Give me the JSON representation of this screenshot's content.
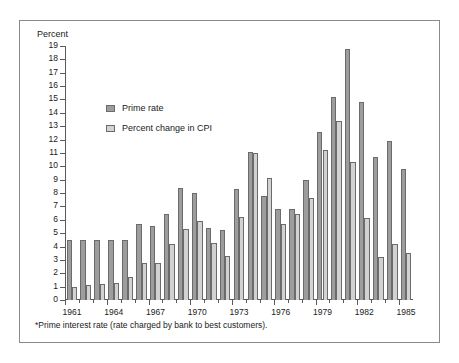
{
  "figure": {
    "y_axis_title": "Percent",
    "footnote": "*Prime interest rate (rate charged by bank to best customers)."
  },
  "legend": {
    "position": "inside-top-left",
    "entries": [
      {
        "label": "Prime rate",
        "color": "#9d9d9d",
        "swatch": "prime"
      },
      {
        "label": "Percent change in CPI",
        "color": "#d2d2d2",
        "swatch": "cpi"
      }
    ]
  },
  "chart_data": {
    "type": "bar",
    "title": "",
    "subtitle": "",
    "xlabel": "",
    "ylabel": "Percent",
    "ylim": [
      0,
      19
    ],
    "ytick_step": 1,
    "yticks": [
      0,
      1,
      2,
      3,
      4,
      5,
      6,
      7,
      8,
      9,
      10,
      11,
      12,
      13,
      14,
      15,
      16,
      17,
      18,
      19
    ],
    "ytick_labels": [
      "0",
      "1",
      "2",
      "3",
      "4",
      "5",
      "6",
      "7",
      "8",
      "9",
      "10",
      "11",
      "12",
      "13",
      "14",
      "15",
      "16",
      "17",
      "18",
      "19"
    ],
    "grid": false,
    "legend_position": "upper left (inside axes)",
    "annotations": [
      "*Prime interest rate (rate charged by bank to best customers)."
    ],
    "categories": [
      "1961",
      "1962",
      "1963",
      "1964",
      "1965",
      "1966",
      "1967",
      "1968",
      "1969",
      "1970",
      "1971",
      "1972",
      "1973",
      "1974",
      "1975",
      "1976",
      "1977",
      "1978",
      "1979",
      "1980",
      "1981",
      "1982",
      "1983",
      "1984",
      "1985"
    ],
    "xtick_labels": [
      "1961",
      "1964",
      "1967",
      "1970",
      "1973",
      "1976",
      "1979",
      "1982",
      "1985"
    ],
    "xtick_categories": [
      "1961",
      "1964",
      "1967",
      "1970",
      "1973",
      "1976",
      "1979",
      "1982",
      "1985"
    ],
    "series": [
      {
        "name": "Prime rate",
        "color": "#9d9d9d",
        "values": [
          4.5,
          4.5,
          4.5,
          4.5,
          4.5,
          5.7,
          5.5,
          6.4,
          8.4,
          8.0,
          5.4,
          5.2,
          8.3,
          11.1,
          7.8,
          6.8,
          6.8,
          9.0,
          12.6,
          15.2,
          18.8,
          14.8,
          10.7,
          11.9,
          9.8
        ],
        "labels": [
          "4.5",
          "4.5",
          "4.5",
          "4.5",
          "4.5",
          "5.7",
          "5.5",
          "6.4",
          "8.4",
          "8.0",
          "5.4",
          "5.2",
          "8.3",
          "11.1",
          "7.8",
          "6.8",
          "6.8",
          "9.0",
          "12.6",
          "15.2",
          "18.8",
          "14.8",
          "10.7",
          "11.9",
          "9.8"
        ]
      },
      {
        "name": "Percent change in CPI",
        "color": "#d2d2d2",
        "values": [
          1.0,
          1.1,
          1.2,
          1.3,
          1.7,
          2.8,
          2.8,
          4.2,
          5.3,
          5.9,
          4.3,
          3.3,
          6.2,
          11.0,
          9.1,
          5.7,
          6.4,
          7.6,
          11.2,
          13.4,
          10.3,
          6.1,
          3.2,
          4.2,
          3.5
        ],
        "labels": [
          "1.0",
          "1.1",
          "1.2",
          "1.3",
          "1.7",
          "2.8",
          "2.8",
          "4.2",
          "5.3",
          "5.9",
          "4.3",
          "3.3",
          "6.2",
          "11.0",
          "9.1",
          "5.7",
          "6.4",
          "7.6",
          "11.2",
          "13.4",
          "10.3",
          "6.1",
          "3.2",
          "4.2",
          "3.5"
        ]
      }
    ]
  }
}
